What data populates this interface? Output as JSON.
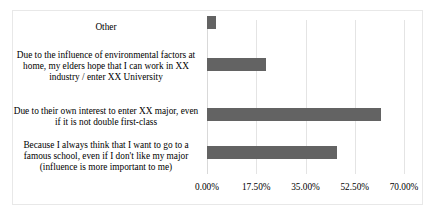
{
  "chart_data": {
    "type": "bar",
    "orientation": "horizontal",
    "title": "",
    "xlabel": "",
    "ylabel": "",
    "grid": true,
    "legend": false,
    "xlim": [
      0,
      70
    ],
    "xticks": [
      0,
      17.5,
      35,
      52.5,
      70
    ],
    "xtick_labels": [
      "0.00%",
      "17.50%",
      "35.00%",
      "52.50%",
      "70.00%"
    ],
    "value_suffix": "%",
    "bar_color": "#636363",
    "categories": [
      "Because I always think that I want to go to a famous school, even if I don't like my major (influence is more important to me)",
      "Due to their own interest to enter XX major, even if it is not double first-class",
      "Due to the influence of environmental factors at home, my elders hope that I can work in XX industry / enter XX University",
      "Other"
    ],
    "values": [
      46.2,
      61.8,
      20.8,
      3.3
    ],
    "series": [
      {
        "name": "Percentage",
        "values": [
          46.2,
          61.8,
          20.8,
          3.3
        ]
      }
    ]
  },
  "axis": {
    "tick_0": "0.00%",
    "tick_1": "17.50%",
    "tick_2": "35.00%",
    "tick_3": "52.50%",
    "tick_4": "70.00%"
  },
  "labels": {
    "cat_other": "Other",
    "cat_environmental": "Due to the influence of environmental factors at home, my elders hope that I can work in XX industry / enter XX University",
    "cat_own_interest": "Due to their own interest to enter XX major, even if it is not double first-class",
    "cat_famous_school": "Because I always think that I want to go to a famous school, even if I don't like my major (influence is more important to me)"
  }
}
